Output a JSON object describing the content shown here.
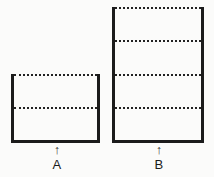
{
  "figure": {
    "background_color": "#fbfbfa",
    "ink_color": "#1b1b1b",
    "arrow_glyph": "↑",
    "stacks": [
      {
        "label": "A",
        "units": 2
      },
      {
        "label": "B",
        "units": 4
      }
    ]
  }
}
